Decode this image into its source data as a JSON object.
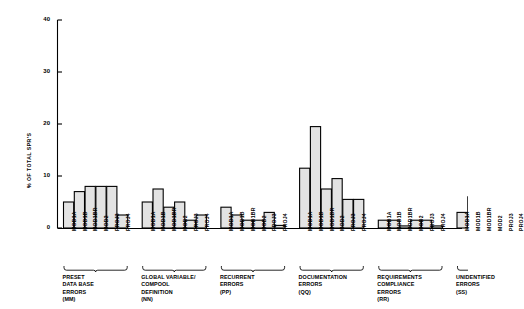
{
  "chart_data": {
    "type": "bar",
    "title": "",
    "xlabel": "",
    "ylabel": "% OF TOTAL SPR'S",
    "ylim": [
      0,
      40
    ],
    "yticks": [
      0,
      10,
      20,
      30,
      40
    ],
    "grid": false,
    "legend": "none",
    "categories": [
      "MOD1A",
      "MOD1B",
      "MOD1BR",
      "MOD2",
      "PROJ3",
      "PROJ4"
    ],
    "groups": [
      {
        "name": "PRESET DATA BASE ERRORS",
        "code": "(MM)",
        "caption_lines": [
          "PRESET",
          "DATA BASE",
          "ERRORS",
          "(MM)"
        ],
        "values": [
          5.0,
          7.0,
          8.0,
          8.0,
          8.0,
          2.5
        ]
      },
      {
        "name": "GLOBAL VARIABLE/ COMPOOL DEFINITION",
        "code": "(NN)",
        "caption_lines": [
          "GLOBAL VARIABLE/",
          "COMPOOL",
          "DEFINITION",
          "(NN)"
        ],
        "values": [
          5.0,
          7.5,
          4.0,
          5.0,
          1.5,
          2.5
        ]
      },
      {
        "name": "RECURRENT ERRORS",
        "code": "(PP)",
        "caption_lines": [
          "RECURRENT",
          "ERRORS",
          "(PP)"
        ],
        "values": [
          4.0,
          2.5,
          1.5,
          1.5,
          3.0,
          0.5
        ]
      },
      {
        "name": "DOCUMENTATION ERRORS",
        "code": "(QQ)",
        "caption_lines": [
          "DOCUMENTATION",
          "ERRORS",
          "(QQ)"
        ],
        "values": [
          11.5,
          19.5,
          7.5,
          9.5,
          5.5,
          5.5
        ]
      },
      {
        "name": "REQUIREMENTS COMPLIANCE ERRORS",
        "code": "(RR)",
        "caption_lines": [
          "REQUIREMENTS",
          "COMPLIANCE",
          "ERRORS",
          "(RR)"
        ],
        "values": [
          1.5,
          1.5,
          0.4,
          1.5,
          1.5,
          0.4
        ]
      },
      {
        "name": "UNIDENTIFIED ERRORS",
        "code": "(SS)",
        "caption_lines": [
          "UNIDENTIFIED",
          "ERRORS",
          "(SS)"
        ],
        "values": [
          3.0,
          6.0,
          7.5,
          9.0,
          5.0,
          0.4
        ]
      }
    ]
  },
  "style": {
    "bar_fill": "#e3e3e3",
    "bar_stroke": "#000000",
    "axis_color": "#000000"
  }
}
